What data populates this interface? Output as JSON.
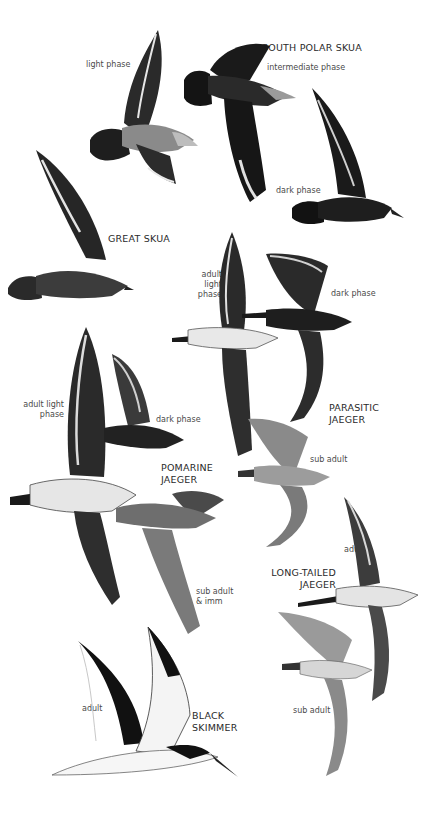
{
  "plate": {
    "species": [
      {
        "name": "SOUTH POLAR SKUA",
        "phases": [
          "light phase",
          "intermediate phase",
          "dark phase"
        ]
      },
      {
        "name": "GREAT SKUA",
        "phases": []
      },
      {
        "name": "PARASITIC\nJAEGER",
        "phases": [
          "adult light\nphase",
          "dark phase",
          "sub adult"
        ]
      },
      {
        "name": "POMARINE\nJAEGER",
        "phases": [
          "adult light\nphase",
          "dark phase",
          "sub adult\n& imm"
        ]
      },
      {
        "name": "LONG-TAILED\nJAEGER",
        "phases": [
          "adult",
          "sub adult"
        ]
      },
      {
        "name": "BLACK\nSKIMMER",
        "phases": [
          "adult"
        ]
      }
    ]
  },
  "colors": {
    "background": "#ffffff",
    "dark_plumage": "#1c1c1c",
    "mid_plumage": "#5a5a5a",
    "light_plumage": "#d8d8d8",
    "label_text": "#4a4a4a"
  }
}
